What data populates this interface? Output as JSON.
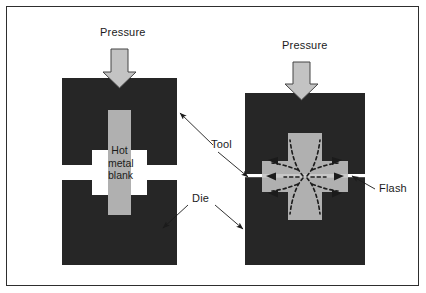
{
  "figure": {
    "background": "#ffffff",
    "frame_color": "#2e2e2e"
  },
  "colors": {
    "die": "#262626",
    "blank": "#b0b0b0",
    "pressure_arrow_fill": "#c3c3c3",
    "pressure_arrow_stroke": "#444444",
    "gap": "#ffffff",
    "flash_line": "#ffffff",
    "leader": "#1b1b1b",
    "flow_arrow": "#1b1b1b",
    "text": "#1b1b1b"
  },
  "stages": {
    "left": {
      "name": "before-forging",
      "pressure_label": "Pressure",
      "blank_label_lines": [
        "Hot",
        "metal",
        "blank"
      ]
    },
    "right": {
      "name": "after-forging",
      "pressure_label": "Pressure",
      "flow_arrow_count": 6
    }
  },
  "labels": {
    "tool": "Tool",
    "die": "Die",
    "flash": "Flash"
  }
}
